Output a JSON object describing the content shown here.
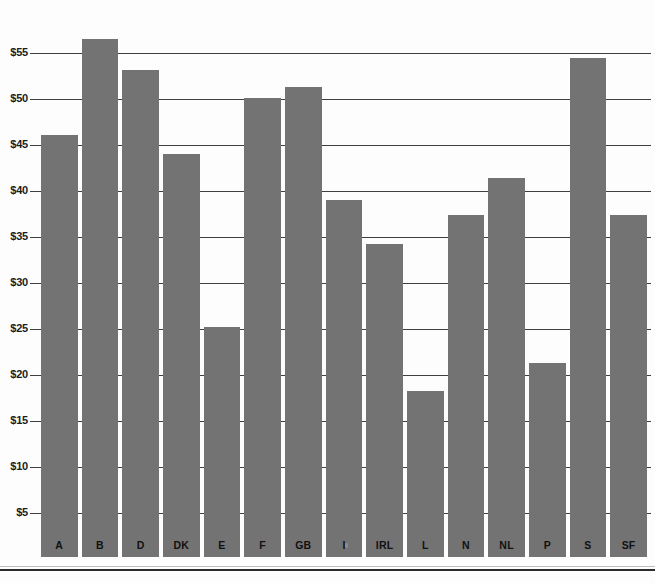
{
  "chart_data": {
    "type": "bar",
    "title": "",
    "subtitle": "",
    "xlabel": "",
    "ylabel": "",
    "categories": [
      "A",
      "B",
      "D",
      "DK",
      "E",
      "F",
      "GB",
      "I",
      "IRL",
      "L",
      "N",
      "NL",
      "P",
      "S",
      "SF"
    ],
    "values": [
      46.1,
      56.5,
      53.2,
      44.0,
      25.2,
      50.1,
      51.3,
      39.0,
      34.2,
      18.3,
      37.4,
      41.4,
      21.3,
      54.5,
      37.4
    ],
    "ylim": [
      0,
      58
    ],
    "yticks": [
      5,
      10,
      15,
      20,
      25,
      30,
      35,
      40,
      45,
      50,
      55
    ],
    "ytick_labels": [
      "$5",
      "$10",
      "$15",
      "$20",
      "$25",
      "$30",
      "$35",
      "$40",
      "$45",
      "$50",
      "$55"
    ],
    "grid": true,
    "grid_axis": "y",
    "legend": false,
    "legend_position": "none",
    "bar_color": "#737373",
    "gridline_color": "#3f3f3f",
    "axis_text_color": "#111111",
    "background_color": "#fdfdfd",
    "value_prefix": "$",
    "series": [
      {
        "name": "",
        "values": [
          46.1,
          56.5,
          53.2,
          44.0,
          25.2,
          50.1,
          51.3,
          39.0,
          34.2,
          18.3,
          37.4,
          41.4,
          21.3,
          54.5,
          37.4
        ]
      }
    ]
  },
  "footer": {
    "corner_mark": ""
  }
}
